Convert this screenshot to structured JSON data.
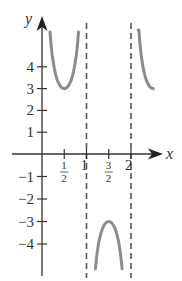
{
  "chart_data": {
    "type": "line",
    "title": "",
    "function": "y = 3 csc(pi x)",
    "xlabel": "x",
    "ylabel": "y",
    "x_ticks": [
      {
        "value": 0.5,
        "label_num": "1",
        "label_den": "2"
      },
      {
        "value": 1,
        "label": "1"
      },
      {
        "value": 1.5,
        "label_num": "3",
        "label_den": "2"
      },
      {
        "value": 2,
        "label": "2"
      }
    ],
    "y_ticks": [
      {
        "value": 4,
        "label": "4"
      },
      {
        "value": 3,
        "label": "3"
      },
      {
        "value": 2,
        "label": "2"
      },
      {
        "value": 1,
        "label": "1"
      },
      {
        "value": -1,
        "label": "−1"
      },
      {
        "value": -2,
        "label": "−2"
      },
      {
        "value": -3,
        "label": "−3"
      },
      {
        "value": -4,
        "label": "−4"
      }
    ],
    "asymptotes": [
      1,
      2
    ],
    "xlim": [
      0,
      2.6
    ],
    "ylim": [
      -5.6,
      6.2
    ],
    "grid": false,
    "series": [
      {
        "name": "branch-1",
        "x": [
          0.18,
          0.25,
          0.33,
          0.42,
          0.5,
          0.58,
          0.67,
          0.75,
          0.82
        ],
        "y": [
          5.6,
          4.24,
          3.46,
          3.09,
          3.0,
          3.09,
          3.46,
          4.24,
          5.6
        ]
      },
      {
        "name": "branch-2",
        "x": [
          1.2,
          1.25,
          1.33,
          1.42,
          1.5,
          1.58,
          1.67,
          1.75,
          1.8
        ],
        "y": [
          -5.1,
          -4.24,
          -3.46,
          -3.09,
          -3.0,
          -3.09,
          -3.46,
          -4.24,
          -5.1
        ]
      },
      {
        "name": "branch-3",
        "x": [
          2.16,
          2.25,
          2.33,
          2.42,
          2.5
        ],
        "y": [
          6.0,
          4.24,
          3.46,
          3.09,
          3.0
        ]
      }
    ],
    "colors": {
      "curve": "#8c8c8c",
      "axis": "#333333",
      "asymptote": "#555555"
    }
  }
}
